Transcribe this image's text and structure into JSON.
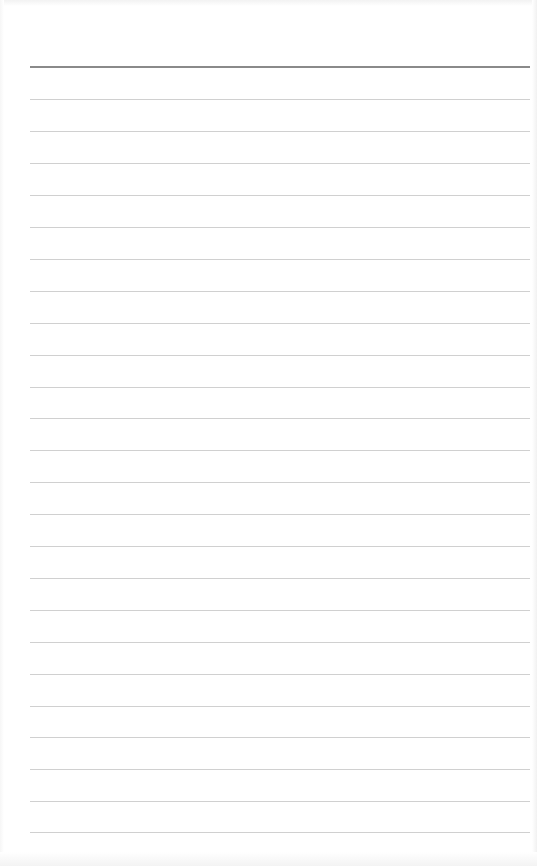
{
  "page": {
    "type": "lined-paper",
    "background_color": "#ffffff",
    "header_rule": {
      "y": 66,
      "color": "#8a8a8a",
      "thickness": 2
    },
    "rules": {
      "color": "#d0d0d0",
      "thickness": 1,
      "x_start": 30,
      "x_end": 530,
      "positions_y": [
        99,
        131,
        163,
        195,
        227,
        259,
        291,
        323,
        355,
        387,
        418,
        450,
        482,
        514,
        546,
        578,
        610,
        642,
        674,
        706,
        737,
        769,
        801,
        832
      ]
    }
  }
}
